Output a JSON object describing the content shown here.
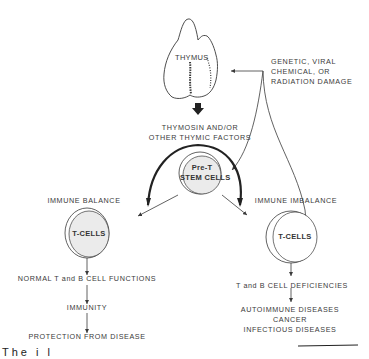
{
  "diagram": {
    "nodes": {
      "thymus": "THYMUS",
      "damage": [
        "GENETIC, VIRAL",
        "CHEMICAL, OR",
        "RADIATION  DAMAGE"
      ],
      "factors": [
        "THYMOSIN  AND/OR",
        "OTHER  THYMIC  FACTORS"
      ],
      "stem_cells": [
        "Pre-T",
        "STEM CELLS"
      ],
      "balance_title": "IMMUNE  BALANCE",
      "imbalance_title": "IMMUNE  IMBALANCE",
      "tcells_left": "T-CELLS",
      "tcells_right": "T-CELLS",
      "normal_functions": "NORMAL  T and B  CELL  FUNCTIONS",
      "immunity": "IMMUNITY",
      "protection": "PROTECTION  FROM  DISEASE",
      "deficiencies": "T and  B  CELL  DEFICIENCIES",
      "diseases": [
        "AUTOIMMUNE  DISEASES",
        "CANCER",
        "INFECTIOUS  DISEASES"
      ]
    },
    "edges": [
      {
        "from": "damage",
        "to": "thymus"
      },
      {
        "from": "thymus",
        "to": "factors"
      },
      {
        "from": "damage",
        "to": "stem_cells"
      },
      {
        "from": "damage",
        "to": "tcells_right"
      },
      {
        "from": "stem_cells",
        "to": "tcells_left"
      },
      {
        "from": "stem_cells",
        "to": "tcells_right"
      },
      {
        "from": "tcells_left",
        "to": "normal_functions"
      },
      {
        "from": "normal_functions",
        "to": "immunity"
      },
      {
        "from": "immunity",
        "to": "protection"
      },
      {
        "from": "tcells_right",
        "to": "deficiencies"
      },
      {
        "from": "deficiencies",
        "to": "diseases"
      }
    ],
    "caption_fragment": "The  i  l"
  },
  "colors": {
    "line": "#3a3a3a",
    "cell_fill": "#ebebeb",
    "background": "#ffffff"
  }
}
